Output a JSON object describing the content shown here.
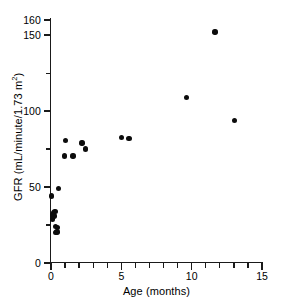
{
  "chart_data": {
    "type": "scatter",
    "title": "",
    "xlabel": "Age (months)",
    "ylabel": "GFR (mL/minute/1.73 m²)",
    "ylabel_main": "GFR (mL/minute/1.73 m",
    "ylabel_sup": "2",
    "ylabel_close": ")",
    "xlim": [
      0,
      15
    ],
    "ylim": [
      0,
      160
    ],
    "grid": false,
    "legend": null,
    "marker": {
      "shape": "circle",
      "color": "#0c0c0c",
      "size_px": 5.4
    },
    "x_ticks_major": [
      0,
      5,
      10,
      15
    ],
    "x_tick_labels": [
      "0",
      "5",
      "10",
      "15"
    ],
    "x_ticks_minor": [
      1,
      2,
      3,
      4,
      6,
      7,
      8,
      9,
      11,
      12,
      13,
      14
    ],
    "y_ticks_major": [
      0,
      50,
      100,
      150,
      160
    ],
    "y_tick_labels": [
      "0",
      "50",
      "100",
      "150",
      "160"
    ],
    "y_ticks_minor": [
      25,
      75,
      125
    ],
    "points": [
      {
        "x": 0.05,
        "y": 44.0
      },
      {
        "x": 0.1,
        "y": 31.5
      },
      {
        "x": 0.12,
        "y": 29.0
      },
      {
        "x": 0.18,
        "y": 33.0
      },
      {
        "x": 0.22,
        "y": 31.0
      },
      {
        "x": 0.28,
        "y": 34.0
      },
      {
        "x": 0.3,
        "y": 24.0
      },
      {
        "x": 0.33,
        "y": 20.0
      },
      {
        "x": 0.42,
        "y": 20.5
      },
      {
        "x": 0.48,
        "y": 23.5
      },
      {
        "x": 0.55,
        "y": 49.0
      },
      {
        "x": 0.95,
        "y": 70.5
      },
      {
        "x": 1.05,
        "y": 80.5
      },
      {
        "x": 1.55,
        "y": 70.5
      },
      {
        "x": 2.2,
        "y": 79.0
      },
      {
        "x": 2.45,
        "y": 75.0
      },
      {
        "x": 5.0,
        "y": 82.5
      },
      {
        "x": 5.55,
        "y": 82.0
      },
      {
        "x": 9.65,
        "y": 109.0
      },
      {
        "x": 11.65,
        "y": 152.0
      },
      {
        "x": 13.05,
        "y": 94.0
      }
    ]
  }
}
